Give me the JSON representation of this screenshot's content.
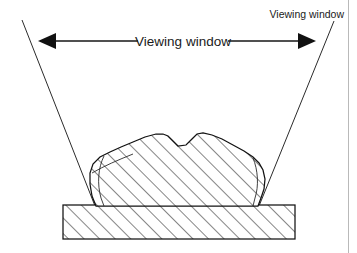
{
  "figure": {
    "background_color": "#ffffff",
    "ink_color": "#1a1a1a",
    "border_color": "#b9b9b9",
    "width": 357,
    "height": 253
  },
  "labels": {
    "main_label": "Viewing window",
    "corner_label": "Viewing window"
  },
  "annotations": {
    "dimension_arrow": {
      "name": "viewing-window-span-arrow",
      "style": "double-headed",
      "x_start": 40,
      "x_end": 314,
      "y": 41
    },
    "sight_lines": [
      {
        "name": "left-sight-line",
        "x_top": 22,
        "y_top": 20,
        "x_bottom": 95,
        "y_bottom": 206
      },
      {
        "name": "right-sight-line",
        "x_top": 334,
        "y_top": 21,
        "x_bottom": 259,
        "y_bottom": 206
      }
    ]
  },
  "geometry": {
    "base_block": {
      "name": "base-block",
      "x": 63,
      "y": 205,
      "width": 232,
      "height": 34,
      "hatched": true
    },
    "specimen": {
      "name": "specimen-rock",
      "description": "irregular hatched cross-section sitting on base block",
      "hatched": true,
      "hatch_angle_degrees": 45,
      "hatch_spacing": 11
    }
  },
  "hatching": {
    "angle_degrees": 45,
    "spacing_px": 11,
    "color": "#171717"
  }
}
